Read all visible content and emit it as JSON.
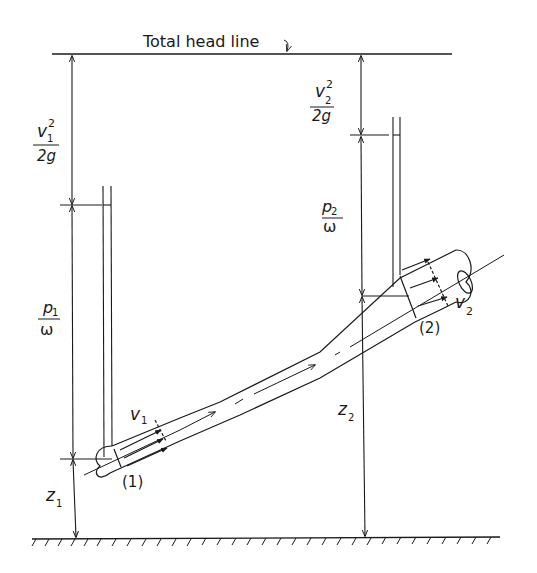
{
  "title_label": "Total head line",
  "colors": {
    "ink": "#1a1a1a",
    "background": "#ffffff"
  },
  "labels": {
    "velocity_head_1": {
      "numerator": "v",
      "subscript": "1",
      "superscript": "2",
      "denominator": "2g"
    },
    "pressure_head_1": {
      "numerator": "p",
      "subscript": "1",
      "denominator": "ω"
    },
    "elevation_1": {
      "symbol": "z",
      "subscript": "1"
    },
    "velocity_head_2": {
      "numerator": "v",
      "subscript": "2",
      "superscript": "2",
      "denominator": "2g"
    },
    "pressure_head_2": {
      "numerator": "p",
      "subscript": "2",
      "denominator": "ω"
    },
    "elevation_2": {
      "symbol": "z",
      "subscript": "2"
    },
    "velocity_1": {
      "symbol": "v",
      "subscript": "1"
    },
    "velocity_2": {
      "symbol": "v",
      "subscript": "2"
    },
    "section_1": "(1)",
    "section_2": "(2)"
  }
}
